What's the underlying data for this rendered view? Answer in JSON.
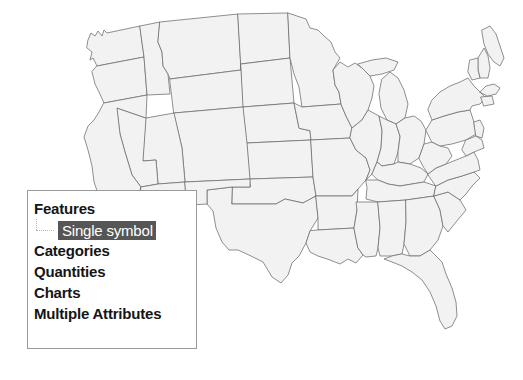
{
  "app": {
    "view_name": "map-symbology-view",
    "background_color": "#ffffff"
  },
  "map": {
    "name": "united-states-map",
    "title": "United States",
    "fill_color": "#f2f2f2",
    "outline_color": "#6b6b6b",
    "feature_type": "states"
  },
  "symbology_panel": {
    "border_color": "#9a9a9a",
    "background_color": "#ffffff",
    "selection_color": "#565656",
    "selection_text_color": "#ffffff",
    "tree": [
      {
        "label": "Features",
        "level": 0,
        "selected": false,
        "children": [
          {
            "label": "Single symbol",
            "level": 1,
            "selected": true
          }
        ]
      },
      {
        "label": "Categories",
        "level": 0,
        "selected": false,
        "children": []
      },
      {
        "label": "Quantities",
        "level": 0,
        "selected": false,
        "children": []
      },
      {
        "label": "Charts",
        "level": 0,
        "selected": false,
        "children": []
      },
      {
        "label": "Multiple Attributes",
        "level": 0,
        "selected": false,
        "children": []
      }
    ]
  }
}
